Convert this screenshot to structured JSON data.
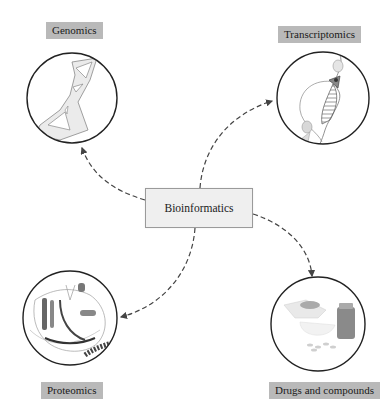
{
  "diagram": {
    "center": {
      "label": "Bioinformatics"
    },
    "nodes": [
      {
        "id": "genomics",
        "label": "Genomics",
        "icon": "dna-helix-icon"
      },
      {
        "id": "transcriptomics",
        "label": "Transcriptomics",
        "icon": "rna-transcription-icon"
      },
      {
        "id": "proteomics",
        "label": "Proteomics",
        "icon": "protein-structure-icon"
      },
      {
        "id": "drugs",
        "label": "Drugs and compounds",
        "icon": "mortar-pills-bottle-icon"
      }
    ],
    "edges": [
      {
        "from": "Bioinformatics",
        "to": "Genomics",
        "style": "dashed-arrow"
      },
      {
        "from": "Bioinformatics",
        "to": "Transcriptomics",
        "style": "dashed-arrow"
      },
      {
        "from": "Bioinformatics",
        "to": "Proteomics",
        "style": "dashed-arrow"
      },
      {
        "from": "Bioinformatics",
        "to": "Drugs and compounds",
        "style": "dashed-arrow"
      }
    ],
    "colors": {
      "label_bg": "#b9b9b9",
      "center_bg": "#efefef",
      "line": "#444444"
    }
  }
}
